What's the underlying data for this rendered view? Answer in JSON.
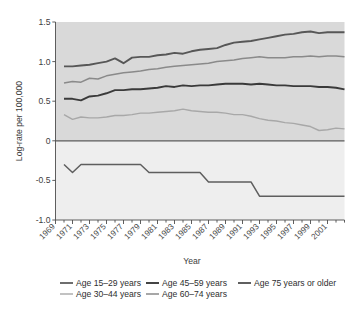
{
  "chart_data": {
    "type": "line",
    "title": "",
    "xlabel": "Year",
    "ylabel": "Log-rate per 100,000",
    "xlim": [
      1969,
      2003
    ],
    "ylim": [
      -1.0,
      1.5
    ],
    "grid": false,
    "legend_position": "bottom",
    "ytick_labels": [
      "1.5",
      "1.0",
      "0.5",
      "0",
      "-0.5",
      "-1.0"
    ],
    "ytick_values": [
      1.5,
      1.0,
      0.5,
      0,
      -0.5,
      -1.0
    ],
    "xtick_labels": [
      "1969",
      "1971",
      "1973",
      "1975",
      "1977",
      "1979",
      "1981",
      "1983",
      "1985",
      "1987",
      "1989",
      "1991",
      "1993",
      "1995",
      "1997",
      "1999",
      "2001"
    ],
    "xtick_values": [
      1969,
      1971,
      1973,
      1975,
      1977,
      1979,
      1981,
      1983,
      1985,
      1987,
      1989,
      1991,
      1993,
      1995,
      1997,
      1999,
      2001
    ],
    "x": [
      1970,
      1971,
      1972,
      1973,
      1974,
      1975,
      1976,
      1977,
      1978,
      1979,
      1980,
      1981,
      1982,
      1983,
      1984,
      1985,
      1986,
      1987,
      1988,
      1989,
      1990,
      1991,
      1992,
      1993,
      1994,
      1995,
      1996,
      1997,
      1998,
      1999,
      2000,
      2001,
      2002,
      2003
    ],
    "series": [
      {
        "name": "Age 75 years or older",
        "color": "#575757",
        "width": 1.9,
        "values": [
          0.94,
          0.94,
          0.95,
          0.96,
          0.98,
          1.0,
          1.04,
          0.98,
          1.05,
          1.06,
          1.06,
          1.08,
          1.09,
          1.11,
          1.1,
          1.13,
          1.15,
          1.16,
          1.17,
          1.21,
          1.24,
          1.25,
          1.26,
          1.28,
          1.3,
          1.32,
          1.34,
          1.35,
          1.37,
          1.38,
          1.36,
          1.37,
          1.37,
          1.37
        ]
      },
      {
        "name": "Age 60-74 years",
        "color": "#8a8a8a",
        "width": 1.5,
        "values": [
          0.73,
          0.75,
          0.74,
          0.79,
          0.78,
          0.82,
          0.84,
          0.86,
          0.87,
          0.88,
          0.9,
          0.91,
          0.93,
          0.94,
          0.95,
          0.96,
          0.97,
          0.98,
          1.0,
          1.01,
          1.02,
          1.04,
          1.05,
          1.06,
          1.05,
          1.05,
          1.05,
          1.06,
          1.06,
          1.07,
          1.06,
          1.07,
          1.07,
          1.06
        ]
      },
      {
        "name": "Age 45-59 years",
        "color": "#3a3a3a",
        "width": 1.9,
        "values": [
          0.53,
          0.53,
          0.51,
          0.56,
          0.57,
          0.6,
          0.64,
          0.64,
          0.65,
          0.65,
          0.66,
          0.67,
          0.69,
          0.68,
          0.7,
          0.69,
          0.7,
          0.7,
          0.71,
          0.72,
          0.72,
          0.72,
          0.71,
          0.72,
          0.71,
          0.7,
          0.7,
          0.69,
          0.69,
          0.69,
          0.68,
          0.68,
          0.67,
          0.65
        ]
      },
      {
        "name": "Age 30-44 years",
        "color": "#a8a8a8",
        "width": 1.4,
        "values": [
          0.33,
          0.27,
          0.3,
          0.29,
          0.29,
          0.3,
          0.32,
          0.32,
          0.33,
          0.35,
          0.35,
          0.36,
          0.37,
          0.38,
          0.4,
          0.38,
          0.37,
          0.36,
          0.36,
          0.35,
          0.33,
          0.33,
          0.31,
          0.28,
          0.26,
          0.25,
          0.23,
          0.22,
          0.2,
          0.18,
          0.13,
          0.14,
          0.16,
          0.15
        ]
      },
      {
        "name": "Age 15-29 years",
        "color": "#5e5e5e",
        "width": 1.5,
        "values": [
          -0.3,
          -0.4,
          -0.3,
          -0.3,
          -0.3,
          -0.3,
          -0.3,
          -0.3,
          -0.3,
          -0.3,
          -0.4,
          -0.4,
          -0.4,
          -0.4,
          -0.4,
          -0.4,
          -0.4,
          -0.52,
          -0.52,
          -0.52,
          -0.52,
          -0.52,
          -0.52,
          -0.7,
          -0.7,
          -0.7,
          -0.7,
          -0.7,
          -0.7,
          -0.7,
          -0.7,
          -0.7,
          -0.7,
          -0.7
        ]
      }
    ],
    "legend": [
      {
        "label": "Age 15–29 years",
        "color": "#5e5e5e",
        "width": 1.8
      },
      {
        "label": "Age 45–59 years",
        "color": "#3a3a3a",
        "width": 1.9
      },
      {
        "label": "Age 75 years or older",
        "color": "#575757",
        "width": 1.9
      },
      {
        "label": "Age 30–44 years",
        "color": "#a8a8a8",
        "width": 1.4
      },
      {
        "label": "Age 60–74 years",
        "color": "#8a8a8a",
        "width": 1.5
      }
    ],
    "background_above_zero": "#d9d9d9",
    "background_below_zero": "#eeeeee"
  }
}
